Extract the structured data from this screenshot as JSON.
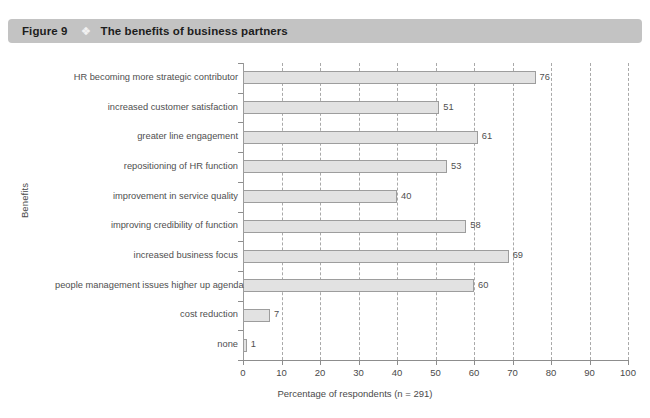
{
  "header": {
    "figure_number": "Figure 9",
    "diamond_icon": "diamond-bullet-icon",
    "diamond_glyph": "❖",
    "title": "The benefits of business partners",
    "bar_color": "#c3c3c3"
  },
  "chart_data": {
    "type": "bar",
    "orientation": "horizontal",
    "title": "The benefits of business partners",
    "xlabel": "Percentage of respondents (n = 291)",
    "ylabel": "Benefits",
    "xlim": [
      0,
      100
    ],
    "xticks": [
      0,
      10,
      20,
      30,
      40,
      50,
      60,
      70,
      80,
      90,
      100
    ],
    "xtick_labels": [
      "0",
      "10",
      "20",
      "30",
      "40",
      "50",
      "60",
      "70",
      "80",
      "90",
      "100"
    ],
    "grid": true,
    "grid_axis": "x",
    "grid_style": "dashed",
    "legend": null,
    "bar_fill": "#e2e2e2",
    "bar_edge": "#9d9d9d",
    "categories": [
      "HR becoming more strategic contributor",
      "increased customer satisfaction",
      "greater line engagement",
      "repositioning of HR function",
      "improvement in service quality",
      "improving credibility of function",
      "increased business focus",
      "people management issues higher up agenda",
      "cost reduction",
      "none"
    ],
    "values": [
      76,
      51,
      61,
      53,
      40,
      58,
      69,
      60,
      7,
      1
    ],
    "value_labels": [
      "76",
      "51",
      "61",
      "53",
      "40",
      "58",
      "69",
      "60",
      "7",
      "1"
    ]
  }
}
